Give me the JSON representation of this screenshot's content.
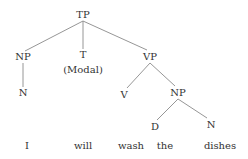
{
  "diagram": {
    "type": "syntax-tree",
    "colors": {
      "text": "#333333",
      "edge": "#8a8a8a",
      "background": "#ffffff"
    },
    "nodes": [
      {
        "id": "TP",
        "label": "TP",
        "x": 83,
        "y": 18
      },
      {
        "id": "NP1",
        "label": "NP",
        "x": 23,
        "y": 60
      },
      {
        "id": "T",
        "label": "T",
        "x": 83,
        "y": 58
      },
      {
        "id": "Modal",
        "label": "(Modal)",
        "x": 83,
        "y": 73
      },
      {
        "id": "VP",
        "label": "VP",
        "x": 150,
        "y": 60
      },
      {
        "id": "N1",
        "label": "N",
        "x": 23,
        "y": 96
      },
      {
        "id": "V",
        "label": "V",
        "x": 124,
        "y": 98
      },
      {
        "id": "NP2",
        "label": "NP",
        "x": 178,
        "y": 96
      },
      {
        "id": "D",
        "label": "D",
        "x": 155,
        "y": 130
      },
      {
        "id": "N2",
        "label": "N",
        "x": 211,
        "y": 128
      }
    ],
    "words": [
      {
        "label": "I",
        "x": 27,
        "y": 149
      },
      {
        "label": "will",
        "x": 83,
        "y": 149
      },
      {
        "label": "wash",
        "x": 131,
        "y": 149
      },
      {
        "label": "the",
        "x": 165,
        "y": 149
      },
      {
        "label": "dishes",
        "x": 220,
        "y": 149
      }
    ],
    "edges": [
      {
        "from": "TP",
        "to": "NP1",
        "x1": 83,
        "y1": 21,
        "x2": 25,
        "y2": 51
      },
      {
        "from": "TP",
        "to": "T",
        "x1": 83,
        "y1": 21,
        "x2": 83,
        "y2": 49
      },
      {
        "from": "TP",
        "to": "VP",
        "x1": 83,
        "y1": 21,
        "x2": 147,
        "y2": 50
      },
      {
        "from": "NP1",
        "to": "N1",
        "x1": 23,
        "y1": 63,
        "x2": 23,
        "y2": 87
      },
      {
        "from": "VP",
        "to": "V",
        "x1": 150,
        "y1": 63,
        "x2": 127,
        "y2": 88
      },
      {
        "from": "VP",
        "to": "NP2",
        "x1": 150,
        "y1": 63,
        "x2": 175,
        "y2": 86
      },
      {
        "from": "NP2",
        "to": "D",
        "x1": 178,
        "y1": 99,
        "x2": 157,
        "y2": 120
      },
      {
        "from": "NP2",
        "to": "N2",
        "x1": 178,
        "y1": 99,
        "x2": 207,
        "y2": 118
      }
    ]
  }
}
